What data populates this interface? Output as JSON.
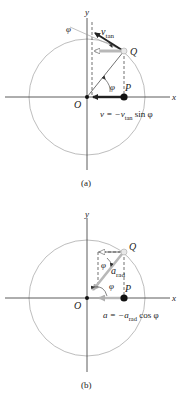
{
  "panels": [
    {
      "id": "a",
      "caption": "(a)",
      "axis_x_label": "x",
      "axis_y_label": "y",
      "origin_label": "O",
      "point_P_label": "P",
      "point_Q_label": "Q",
      "angle_label": "φ",
      "angle_label_top": "φ",
      "vector_label_main": "v",
      "vector_label_sub": "tan",
      "equation": {
        "lhs": "v = −v",
        "sub": "tan",
        "rhs": " sin φ"
      }
    },
    {
      "id": "b",
      "caption": "(b)",
      "axis_x_label": "x",
      "axis_y_label": "y",
      "origin_label": "O",
      "point_P_label": "P",
      "point_Q_label": "Q",
      "angle_label": "φ",
      "angle_label_top": "φ",
      "vector_label_main": "a",
      "vector_label_sub": "rad",
      "equation": {
        "lhs": "a = −a",
        "sub": "rad",
        "rhs": " cos φ"
      }
    }
  ],
  "colors": {
    "axis": "#333333",
    "circle": "#9a9a9a",
    "vector_dark": "#222222",
    "vector_light": "#b8b8b8",
    "point": "#111111"
  }
}
